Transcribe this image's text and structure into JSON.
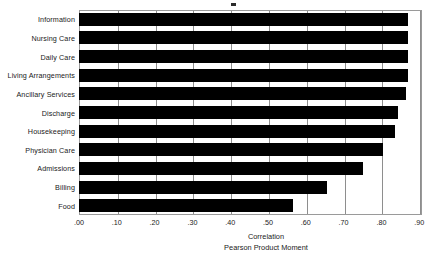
{
  "chart_data": {
    "type": "bar",
    "orientation": "horizontal",
    "title": "",
    "subtitle": "",
    "xlabel": "Correlation",
    "xlabel_sub": "Pearson Product Moment",
    "ylabel": "",
    "xlim": [
      0.0,
      0.9
    ],
    "xtick_labels": [
      ".00",
      ".10",
      ".20",
      ".30",
      ".40",
      ".50",
      ".60",
      ".70",
      ".80",
      ".90"
    ],
    "xtick_values": [
      0.0,
      0.1,
      0.2,
      0.3,
      0.4,
      0.5,
      0.6,
      0.7,
      0.8,
      0.9
    ],
    "grid": "vertical",
    "legend": "none",
    "bar_color": "#000000",
    "categories": [
      "Information",
      "Nursing Care",
      "Daily Care",
      "Living Arrangements",
      "Ancillary Services",
      "Discharge",
      "Housekeeping",
      "Physician Care",
      "Admissions",
      "Billing",
      "Food"
    ],
    "values": [
      0.87,
      0.87,
      0.87,
      0.87,
      0.865,
      0.845,
      0.835,
      0.805,
      0.75,
      0.655,
      0.565
    ]
  }
}
